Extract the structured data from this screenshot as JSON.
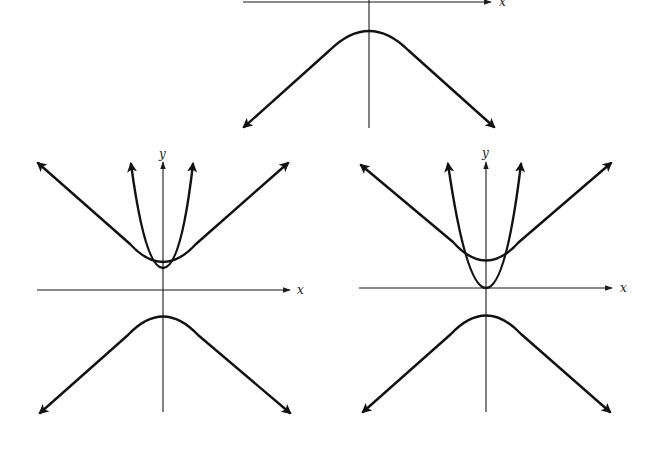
{
  "colors": {
    "background": "#ffffff",
    "ink": "#111111",
    "axis": "#1a1a1a"
  },
  "panels": [
    {
      "id": "top",
      "description": "Lower branch of hyperbola opening downward, asymptotes with arrows",
      "labels": {
        "x": "x"
      },
      "origin": [
        369,
        1
      ],
      "curves": [
        {
          "type": "hyperbola-lower-branch",
          "vertex": [
            369,
            24
          ],
          "left_end": [
            244,
            127
          ],
          "right_end": [
            494,
            127
          ]
        }
      ]
    },
    {
      "id": "bottom-left",
      "description": "Upper hyperbola branch with narrow parabola sharing the same vertex; lower hyperbola branch below x-axis",
      "labels": {
        "x": "x",
        "y": "y"
      },
      "origin": [
        163,
        290
      ],
      "curves": [
        {
          "type": "hyperbola-upper-branch",
          "vertex": [
            163,
            268
          ],
          "left_end": [
            38,
            163
          ],
          "right_end": [
            288,
            163
          ]
        },
        {
          "type": "parabola",
          "vertex": [
            163,
            268
          ],
          "left_end": [
            131,
            164
          ],
          "right_end": [
            193,
            164
          ]
        },
        {
          "type": "hyperbola-lower-branch",
          "vertex": [
            163,
            310
          ],
          "left_end": [
            40,
            413
          ],
          "right_end": [
            290,
            413
          ]
        }
      ]
    },
    {
      "id": "bottom-right",
      "description": "Upper hyperbola branch with parabola whose vertex sits at origin, intersecting hyperbola; lower hyperbola branch below x-axis",
      "labels": {
        "x": "x",
        "y": "y"
      },
      "origin": [
        486,
        288
      ],
      "curves": [
        {
          "type": "hyperbola-upper-branch",
          "vertex": [
            486,
            267
          ],
          "left_end": [
            361,
            165
          ],
          "right_end": [
            611,
            163
          ]
        },
        {
          "type": "parabola",
          "vertex": [
            486,
            288
          ],
          "left_end": [
            448,
            164
          ],
          "right_end": [
            521,
            164
          ]
        },
        {
          "type": "hyperbola-lower-branch",
          "vertex": [
            486,
            309
          ],
          "left_end": [
            363,
            412
          ],
          "right_end": [
            610,
            412
          ]
        }
      ]
    }
  ]
}
